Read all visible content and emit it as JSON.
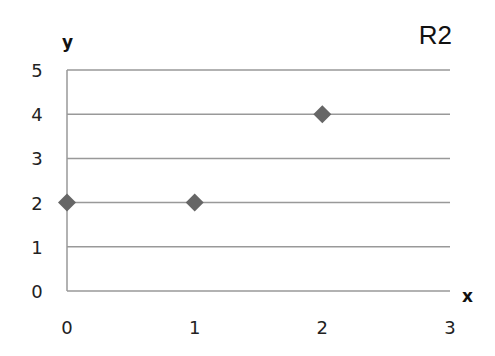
{
  "chart_data": {
    "type": "scatter",
    "title": "R2",
    "xlabel": "x",
    "ylabel": "y",
    "xlim": [
      0,
      3
    ],
    "ylim": [
      0,
      5
    ],
    "x_ticks": [
      "0",
      "1",
      "2",
      "3"
    ],
    "y_ticks": [
      "0",
      "1",
      "2",
      "3",
      "4",
      "5"
    ],
    "grid": "horizontal",
    "legend": "none",
    "series": [
      {
        "name": "R2",
        "marker": "diamond",
        "color": "#666666",
        "points": [
          {
            "x": 0,
            "y": 2
          },
          {
            "x": 1,
            "y": 2
          },
          {
            "x": 2,
            "y": 4
          }
        ]
      }
    ]
  }
}
